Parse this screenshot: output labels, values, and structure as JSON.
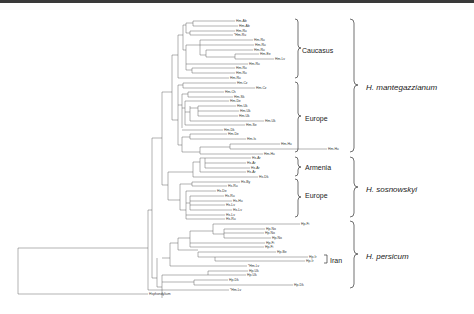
{
  "figure": {
    "type": "phylogenetic-tree",
    "outgroup": "Hsphondylium",
    "leaves": [
      {
        "label": "Hm-Ab",
        "x": 235,
        "y": 21
      },
      {
        "label": "Hm-Ab",
        "x": 238,
        "y": 26
      },
      {
        "label": "Hm-Ru",
        "x": 235,
        "y": 31
      },
      {
        "label": "*Hm-Ru",
        "x": 233,
        "y": 35
      },
      {
        "label": "Hm-Ru",
        "x": 253,
        "y": 40
      },
      {
        "label": "Hm-Ru",
        "x": 254,
        "y": 45
      },
      {
        "label": "Hm-Ru",
        "x": 253,
        "y": 50
      },
      {
        "label": "Hm-Ee",
        "x": 259,
        "y": 54
      },
      {
        "label": "Hm-Lv",
        "x": 274,
        "y": 59
      },
      {
        "label": "Hm-Ru",
        "x": 248,
        "y": 64
      },
      {
        "label": "Hm-Ru",
        "x": 235,
        "y": 68
      },
      {
        "label": "Hm-Ru",
        "x": 235,
        "y": 73
      },
      {
        "label": "Hm-Ru",
        "x": 229,
        "y": 78
      },
      {
        "label": "Hm-Cz",
        "x": 236,
        "y": 83
      },
      {
        "label": "Hm-Cz",
        "x": 255,
        "y": 88
      },
      {
        "label": "Hm-Ch",
        "x": 224,
        "y": 92
      },
      {
        "label": "Hm-Sk",
        "x": 233,
        "y": 97
      },
      {
        "label": "Hm-De",
        "x": 229,
        "y": 101
      },
      {
        "label": "Hm-Uk",
        "x": 236,
        "y": 106
      },
      {
        "label": "Hm-Uk",
        "x": 239,
        "y": 111
      },
      {
        "label": "Hm-Uk",
        "x": 238,
        "y": 116
      },
      {
        "label": "Hm-Uk",
        "x": 264,
        "y": 121
      },
      {
        "label": "Hm-Se",
        "x": 245,
        "y": 125
      },
      {
        "label": "Hm-Dk",
        "x": 223,
        "y": 130
      },
      {
        "label": "Hm-De",
        "x": 227,
        "y": 134
      },
      {
        "label": "Hm-Is",
        "x": 246,
        "y": 139
      },
      {
        "label": "Hm-Hu",
        "x": 280,
        "y": 144
      },
      {
        "label": "Hm-Hu",
        "x": 327,
        "y": 149
      },
      {
        "label": "Hm-Hu",
        "x": 263,
        "y": 154
      },
      {
        "label": "Hs-Ar",
        "x": 251,
        "y": 158
      },
      {
        "label": "Hs-Ar",
        "x": 246,
        "y": 163
      },
      {
        "label": "Hs-Ar",
        "x": 250,
        "y": 168
      },
      {
        "label": "Hs-Ar",
        "x": 246,
        "y": 172
      },
      {
        "label": "Hs-Dk",
        "x": 258,
        "y": 177
      },
      {
        "label": "Hs-By",
        "x": 240,
        "y": 182
      },
      {
        "label": "Hs-Ru",
        "x": 227,
        "y": 186
      },
      {
        "label": "Hs-De",
        "x": 216,
        "y": 191
      },
      {
        "label": "Hs-Ru",
        "x": 224,
        "y": 196
      },
      {
        "label": "Hs-Hu",
        "x": 232,
        "y": 201
      },
      {
        "label": "Hs-Lv",
        "x": 225,
        "y": 205
      },
      {
        "label": "Hs-Lv",
        "x": 232,
        "y": 210
      },
      {
        "label": "Hs-Lv",
        "x": 225,
        "y": 215
      },
      {
        "label": "Hs-Ru",
        "x": 225,
        "y": 219
      },
      {
        "label": "Hp-Fi",
        "x": 300,
        "y": 224
      },
      {
        "label": "Hp-No",
        "x": 265,
        "y": 229
      },
      {
        "label": "Hp-No",
        "x": 264,
        "y": 233
      },
      {
        "label": "Hp-No",
        "x": 271,
        "y": 238
      },
      {
        "label": "Hp-Fi",
        "x": 265,
        "y": 243
      },
      {
        "label": "Hp-Fi",
        "x": 264,
        "y": 247
      },
      {
        "label": "Hp-Be",
        "x": 276,
        "y": 252
      },
      {
        "label": "Hp-Ir",
        "x": 308,
        "y": 257
      },
      {
        "label": "Hp-Ir",
        "x": 305,
        "y": 261
      },
      {
        "label": "*Hm-Lv",
        "x": 247,
        "y": 266
      },
      {
        "label": "Hp-Uk",
        "x": 248,
        "y": 271
      },
      {
        "label": "Hp-Uk",
        "x": 246,
        "y": 275
      },
      {
        "label": "Hp-Dk",
        "x": 228,
        "y": 280
      },
      {
        "label": "Hp-Dk",
        "x": 293,
        "y": 285
      },
      {
        "label": "*Hm-Lv",
        "x": 229,
        "y": 290
      },
      {
        "label": "Hsphondylium",
        "x": 148,
        "y": 294
      }
    ],
    "groups": [
      {
        "label": "Caucasus",
        "level": "region",
        "y_top": 19,
        "y_bot": 78
      },
      {
        "label": "Europe",
        "level": "region",
        "y_top": 82,
        "y_bot": 152
      },
      {
        "label": "Armenia",
        "level": "region",
        "y_top": 157,
        "y_bot": 176
      },
      {
        "label": "Europe",
        "level": "region",
        "y_top": 179,
        "y_bot": 217
      },
      {
        "label": "Iran",
        "level": "region",
        "y_top": 255,
        "y_bot": 263
      },
      {
        "label": "H. mantegazzianum",
        "level": "species",
        "y_top": 19,
        "y_bot": 152
      },
      {
        "label": "H. sosnowskyi",
        "level": "species",
        "y_top": 157,
        "y_bot": 217
      },
      {
        "label": "H. persicum",
        "level": "species",
        "y_top": 221,
        "y_bot": 288
      }
    ]
  }
}
